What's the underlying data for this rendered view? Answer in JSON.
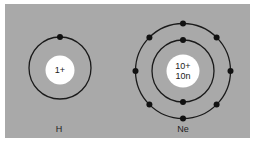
{
  "colors": {
    "background": "#a9a9a9",
    "orbit": "#1a1a1a",
    "nucleus": "#ffffff",
    "electron": "#111111"
  },
  "atoms": [
    {
      "symbol": "H",
      "nucleus_lines": [
        "1+"
      ],
      "shells": [
        1
      ]
    },
    {
      "symbol": "Ne",
      "nucleus_lines": [
        "10+",
        "10n"
      ],
      "shells": [
        2,
        8
      ]
    }
  ]
}
